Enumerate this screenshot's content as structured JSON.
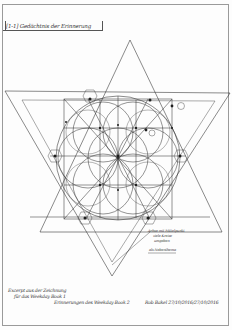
{
  "document": {
    "type": "hand-drawn geometric sketch",
    "header": {
      "label": "[1-1] Gedächtnis der Erinnerung"
    },
    "annotations": {
      "note_lines": [
        "Achse mit Mittelpunkt",
        "viele Kreise",
        "umgeben",
        "als Nebenthema"
      ],
      "circle_marker": "(?)"
    },
    "caption": {
      "line1": "Excerpt aus der Zeichnung",
      "line2": "für das Weekday Book 1",
      "line3": "Erinnerungen des Weekday Book 2"
    },
    "signature": "Rob Bakel 27/10/2016/27/10/2016"
  },
  "colors": {
    "paper": "#fdfdfd",
    "ink": "#2b2b2b",
    "frame": "#9a9a9a"
  }
}
